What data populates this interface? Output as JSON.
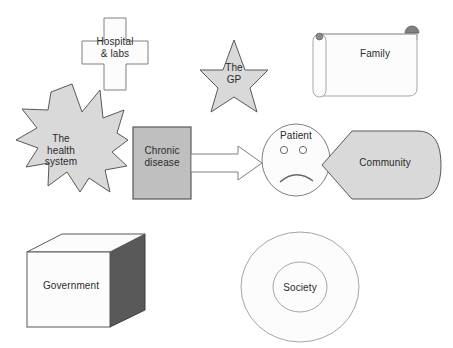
{
  "diagram": {
    "type": "concept-diagram",
    "background_color": "#ffffff",
    "palette": {
      "light_fill": "#fcfcfc",
      "gray_fill": "#d9d9d9",
      "mid_gray_fill": "#bfbfbf",
      "dark_gray_fill": "#595959",
      "outline": "#808080",
      "dark_outline": "#404040",
      "text": "#2b2b2b"
    },
    "nodes": [
      {
        "id": "hospital",
        "label": "Hospital\n& labs",
        "shape": "cross",
        "fill": "#fcfcfc",
        "stroke": "#808080",
        "x": 82,
        "y": 18,
        "width": 66,
        "height": 72
      },
      {
        "id": "gp",
        "label": "The\nGP",
        "shape": "star-5",
        "fill": "#d9d9d9",
        "stroke": "#595959",
        "x": 200,
        "y": 40,
        "width": 68,
        "height": 72
      },
      {
        "id": "family",
        "label": "Family",
        "shape": "scroll",
        "fill": "#fcfcfc",
        "stroke": "#a6a6a6",
        "x": 311,
        "y": 28,
        "width": 118,
        "height": 74
      },
      {
        "id": "health_system",
        "label": "The\nhealth\nsystem",
        "shape": "explosion-12",
        "fill": "#d9d9d9",
        "stroke": "#595959",
        "x": 16,
        "y": 84,
        "width": 112,
        "height": 108
      },
      {
        "id": "chronic_disease",
        "label": "Chronic\ndisease",
        "shape": "rectangle",
        "fill": "#bfbfbf",
        "stroke": "#595959",
        "x": 133,
        "y": 127,
        "width": 58,
        "height": 72
      },
      {
        "id": "patient",
        "label": "Patient",
        "shape": "sad-face",
        "fill": "#fcfcfc",
        "stroke": "#808080",
        "x": 262,
        "y": 124,
        "width": 68,
        "height": 72
      },
      {
        "id": "community",
        "label": "Community",
        "shape": "pentagon-arrow",
        "fill": "#d9d9d9",
        "stroke": "#595959",
        "x": 322,
        "y": 131,
        "width": 119,
        "height": 68
      },
      {
        "id": "government",
        "label": "Government",
        "shape": "cube",
        "fill": "#fcfcfc",
        "side_fill": "#595959",
        "stroke": "#595959",
        "x": 27,
        "y": 234,
        "width": 118,
        "height": 104
      },
      {
        "id": "society",
        "label": "Society",
        "shape": "donut",
        "fill": "#fcfcfc",
        "stroke": "#a6a6a6",
        "x": 241,
        "y": 232,
        "width": 118,
        "height": 110
      }
    ],
    "connectors": [
      {
        "id": "disease-to-patient",
        "from": "chronic_disease",
        "to": "patient",
        "shape": "block-arrow",
        "direction": "right",
        "fill": "#ffffff",
        "stroke": "#808080"
      }
    ]
  }
}
